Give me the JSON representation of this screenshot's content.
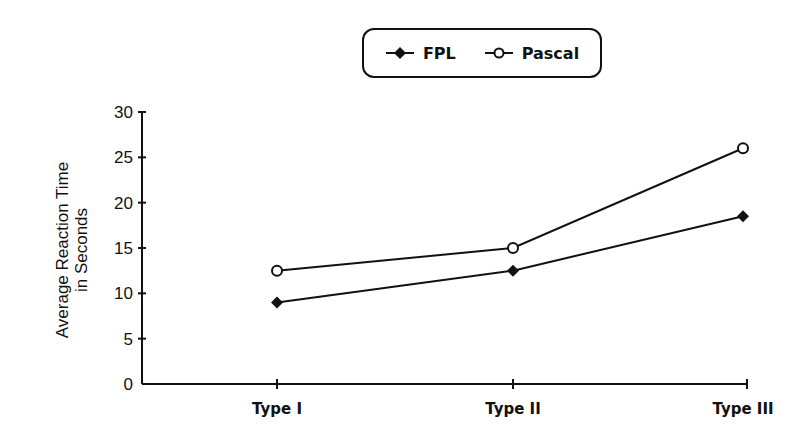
{
  "chart_data": {
    "type": "line",
    "title": "",
    "xlabel": "",
    "ylabel": "Average Reaction Time in Seconds",
    "ylabel_lines": [
      "Average Reaction Time",
      "in Seconds"
    ],
    "categories": [
      "Type I",
      "Type II",
      "Type III"
    ],
    "series": [
      {
        "name": "FPL",
        "marker": "filled-diamond",
        "values": [
          9,
          12.5,
          18.5
        ]
      },
      {
        "name": "Pascal",
        "marker": "open-circle",
        "values": [
          12.5,
          15,
          26
        ]
      }
    ],
    "ylim": [
      0,
      30
    ],
    "yticks": [
      0,
      5,
      10,
      15,
      20,
      25,
      30
    ],
    "grid": false,
    "legend_position": "top-center"
  },
  "legend": {
    "items": [
      {
        "label": "FPL"
      },
      {
        "label": "Pascal"
      }
    ]
  },
  "colors": {
    "ink": "#111111",
    "background": "#ffffff"
  }
}
